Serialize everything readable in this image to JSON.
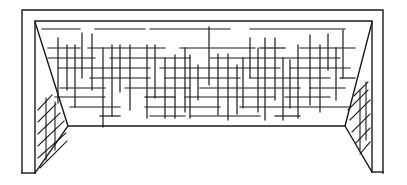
{
  "illustration": {
    "subject": "soccer goal with net",
    "stroke_color": "#1a1a1a",
    "background": "#ffffff",
    "frame": {
      "outer": [
        [
          22,
          173
        ],
        [
          22,
          10
        ],
        [
          383,
          10
        ],
        [
          383,
          173
        ]
      ],
      "left_post_inner": [
        [
          35,
          173
        ],
        [
          35,
          21
        ],
        [
          372,
          21
        ],
        [
          372,
          172
        ]
      ],
      "left_post_bottom": [
        [
          22,
          173
        ],
        [
          35,
          173
        ]
      ],
      "right_post_bottom": [
        [
          372,
          172
        ],
        [
          383,
          172
        ]
      ],
      "left_side_diagonal": [
        [
          35,
          22
        ],
        [
          68,
          126
        ],
        [
          35,
          173
        ]
      ],
      "right_side_diagonal": [
        [
          372,
          22
        ],
        [
          345,
          126
        ],
        [
          372,
          172
        ]
      ],
      "back_bottom": [
        [
          68,
          126
        ],
        [
          345,
          126
        ]
      ]
    },
    "net_horizontal": [
      [
        42,
        29,
        80,
        29
      ],
      [
        95,
        29,
        145,
        29
      ],
      [
        150,
        29,
        230,
        29
      ],
      [
        250,
        29,
        345,
        29
      ],
      [
        48,
        48,
        80,
        48
      ],
      [
        88,
        48,
        165,
        48
      ],
      [
        180,
        48,
        255,
        48
      ],
      [
        260,
        48,
        285,
        48
      ],
      [
        300,
        48,
        355,
        48
      ],
      [
        48,
        58,
        95,
        58
      ],
      [
        110,
        58,
        190,
        58
      ],
      [
        210,
        58,
        340,
        58
      ],
      [
        58,
        68,
        150,
        68
      ],
      [
        160,
        68,
        280,
        68
      ],
      [
        290,
        68,
        350,
        68
      ],
      [
        90,
        78,
        150,
        78
      ],
      [
        165,
        78,
        240,
        78
      ],
      [
        250,
        78,
        330,
        78
      ],
      [
        340,
        78,
        355,
        78
      ],
      [
        60,
        88,
        105,
        88
      ],
      [
        125,
        88,
        190,
        88
      ],
      [
        200,
        88,
        300,
        88
      ],
      [
        310,
        88,
        345,
        88
      ],
      [
        55,
        97,
        105,
        97
      ],
      [
        145,
        97,
        175,
        97
      ],
      [
        185,
        97,
        275,
        97
      ],
      [
        285,
        97,
        330,
        97
      ],
      [
        70,
        107,
        120,
        107
      ],
      [
        145,
        107,
        220,
        107
      ],
      [
        240,
        107,
        350,
        107
      ],
      [
        100,
        116,
        120,
        116
      ],
      [
        150,
        116,
        185,
        116
      ],
      [
        190,
        116,
        260,
        116
      ],
      [
        275,
        116,
        300,
        116
      ]
    ],
    "net_vertical": [
      [
        58,
        38,
        58,
        103
      ],
      [
        67,
        45,
        67,
        90
      ],
      [
        75,
        45,
        75,
        107
      ],
      [
        82,
        33,
        82,
        78
      ],
      [
        92,
        34,
        92,
        90
      ],
      [
        103,
        48,
        103,
        127
      ],
      [
        112,
        45,
        112,
        116
      ],
      [
        120,
        45,
        120,
        92
      ],
      [
        130,
        45,
        130,
        110
      ],
      [
        147,
        45,
        147,
        118
      ],
      [
        155,
        45,
        155,
        98
      ],
      [
        165,
        58,
        165,
        118
      ],
      [
        175,
        55,
        175,
        118
      ],
      [
        185,
        48,
        185,
        112
      ],
      [
        190,
        55,
        190,
        118
      ],
      [
        198,
        65,
        198,
        100
      ],
      [
        209,
        27,
        209,
        85
      ],
      [
        218,
        54,
        218,
        115
      ],
      [
        228,
        54,
        228,
        120
      ],
      [
        237,
        65,
        237,
        114
      ],
      [
        243,
        58,
        243,
        108
      ],
      [
        250,
        38,
        250,
        78
      ],
      [
        258,
        48,
        258,
        112
      ],
      [
        265,
        38,
        265,
        120
      ],
      [
        275,
        38,
        275,
        100
      ],
      [
        283,
        58,
        283,
        120
      ],
      [
        290,
        60,
        290,
        108
      ],
      [
        298,
        45,
        298,
        118
      ],
      [
        310,
        35,
        310,
        105
      ],
      [
        320,
        45,
        320,
        112
      ],
      [
        328,
        34,
        328,
        70
      ],
      [
        336,
        48,
        336,
        100
      ],
      [
        343,
        30,
        343,
        78
      ]
    ],
    "left_side_hatching": [
      [
        38,
        110,
        52,
        95
      ],
      [
        38,
        122,
        56,
        104
      ],
      [
        38,
        134,
        60,
        113
      ],
      [
        38,
        146,
        64,
        121
      ],
      [
        38,
        158,
        66,
        133
      ],
      [
        40,
        168,
        67,
        141
      ],
      [
        46,
        98,
        46,
        160
      ],
      [
        55,
        102,
        55,
        150
      ]
    ],
    "right_side_hatching": [
      [
        350,
        120,
        370,
        100
      ],
      [
        352,
        132,
        370,
        114
      ],
      [
        356,
        143,
        370,
        128
      ],
      [
        360,
        154,
        370,
        142
      ],
      [
        348,
        110,
        368,
        90
      ],
      [
        354,
        96,
        368,
        82
      ],
      [
        360,
        90,
        360,
        150
      ],
      [
        366,
        82,
        366,
        140
      ]
    ]
  }
}
